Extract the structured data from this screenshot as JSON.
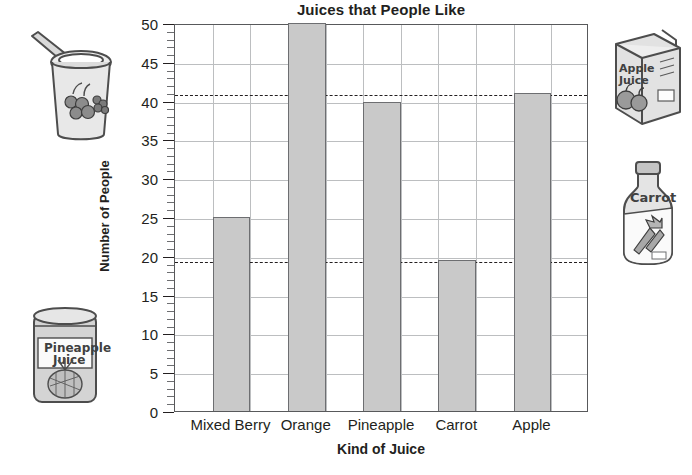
{
  "chart_data": {
    "type": "bar",
    "title": "Juices that People Like",
    "xlabel": "Kind of Juice",
    "ylabel": "Number of People",
    "categories": [
      "Mixed Berry",
      "Orange",
      "Pineapple",
      "Carrot",
      "Apple"
    ],
    "values": [
      25,
      50,
      39.8,
      19.5,
      41
    ],
    "ylim": [
      0,
      50
    ],
    "ytick_labels": [
      "0",
      "5",
      "10",
      "15",
      "20",
      "25",
      "30",
      "35",
      "40",
      "45",
      "50"
    ],
    "ytick_values": [
      0,
      5,
      10,
      15,
      20,
      25,
      30,
      35,
      40,
      45,
      50
    ],
    "minor_tick_step": 1,
    "grid": "both",
    "legend": "none",
    "bar_color": "#c9c9c9",
    "bar_border_color": "#6d6e71",
    "grid_color": "#bcbec0",
    "axis_color": "#58595b",
    "annotations": [
      {
        "type": "dashed-reference-line",
        "value": 41,
        "label": "",
        "color": "#231f20"
      },
      {
        "type": "dashed-reference-line",
        "value": 19.5,
        "label": "",
        "color": "#231f20"
      }
    ]
  },
  "illustrations": [
    {
      "name": "mixed-berry-cup",
      "label": "",
      "position": "top-left"
    },
    {
      "name": "pineapple-juice-can",
      "label": "Pineapple Juice",
      "position": "bottom-left"
    },
    {
      "name": "apple-juice-carton",
      "label": "Apple Juice",
      "position": "top-right"
    },
    {
      "name": "carrot-juice-bottle",
      "label": "Carrot",
      "position": "right"
    }
  ]
}
